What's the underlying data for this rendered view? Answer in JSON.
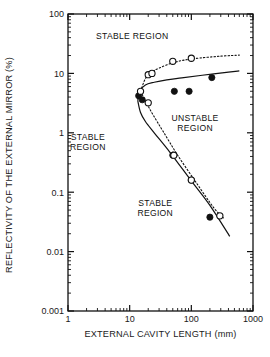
{
  "chart_data": {
    "type": "scatter",
    "title": "",
    "xlabel": "EXTERNAL CAVITY LENGTH (mm)",
    "ylabel": "REFLECTIVITY OF THE EXTERNAL MIRROR (%)",
    "xscale": "log",
    "yscale": "log",
    "xlim": [
      1,
      1000
    ],
    "ylim": [
      0.001,
      100
    ],
    "grid": false,
    "legend": null,
    "xticks": [
      "1",
      "10",
      "100",
      "1000"
    ],
    "yticks": [
      "100",
      "10",
      "1",
      "0.1",
      "0.01",
      "0.001"
    ],
    "annotations": [
      {
        "text": "STABLE REGION",
        "x": 11,
        "y": 42,
        "id": "stable-region-top"
      },
      {
        "text": "STABLE",
        "x": 2.1,
        "y": 0.85,
        "id": "stable-region-left-line1"
      },
      {
        "text": "REGION",
        "x": 2.1,
        "y": 0.58,
        "id": "stable-region-left-line2"
      },
      {
        "text": "UNSTABLE",
        "x": 115,
        "y": 1.75,
        "id": "unstable-region-line1"
      },
      {
        "text": "REGION",
        "x": 115,
        "y": 1.2,
        "id": "unstable-region-line2"
      },
      {
        "text": "STABLE",
        "x": 26,
        "y": 0.065,
        "id": "stable-region-bottom-line1"
      },
      {
        "text": "REGION",
        "x": 26,
        "y": 0.045,
        "id": "stable-region-bottom-line2"
      }
    ],
    "series": [
      {
        "name": "filled-circles",
        "marker": "filled-circle",
        "x": [
          14,
          16,
          53,
          92,
          215,
          50,
          100,
          200
        ],
        "y": [
          4.2,
          3.6,
          5.0,
          5.0,
          8.5,
          0.42,
          0.16,
          0.038
        ]
      },
      {
        "name": "open-circles",
        "marker": "open-circle",
        "x": [
          15,
          20,
          23,
          50,
          100,
          20,
          52,
          100,
          290
        ],
        "y": [
          5.0,
          9.5,
          10.0,
          16.0,
          18.0,
          3.2,
          0.42,
          0.16,
          0.04
        ]
      },
      {
        "name": "solid-curve-upper",
        "style": "solid-line",
        "x": [
          13.5,
          15,
          18,
          25,
          40,
          70,
          150,
          400,
          600
        ],
        "y": [
          3.5,
          5.2,
          6.4,
          7.1,
          7.8,
          8.4,
          9.3,
          10.5,
          11.0
        ]
      },
      {
        "name": "solid-curve-lower",
        "style": "solid-line",
        "x": [
          13.5,
          15,
          18,
          25,
          45,
          100,
          200,
          420
        ],
        "y": [
          3.5,
          2.2,
          1.55,
          1.0,
          0.47,
          0.155,
          0.06,
          0.018
        ]
      },
      {
        "name": "dotted-curve-upper",
        "style": "dotted-line",
        "x": [
          15,
          18,
          22,
          30,
          55,
          110,
          300,
          600
        ],
        "y": [
          5.0,
          8.2,
          10.2,
          12.3,
          15.5,
          17.7,
          19.5,
          20.3
        ]
      },
      {
        "name": "dotted-curve-lower",
        "style": "dotted-line",
        "x": [
          15,
          19,
          24,
          35,
          60,
          120,
          230,
          330
        ],
        "y": [
          5.0,
          3.1,
          2.0,
          1.05,
          0.42,
          0.145,
          0.055,
          0.037
        ]
      }
    ]
  },
  "axes": {
    "y_label": "REFLECTIVITY OF THE EXTERNAL MIRROR (%)",
    "x_label": "EXTERNAL CAVITY LENGTH (mm)"
  }
}
